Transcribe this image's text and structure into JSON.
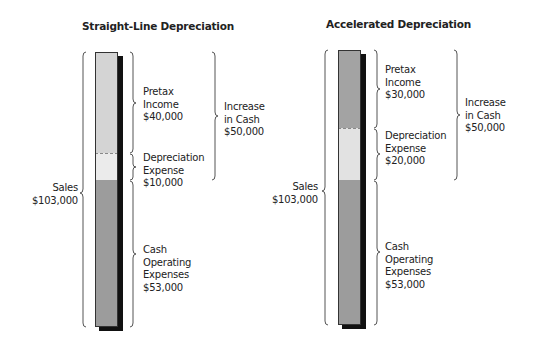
{
  "colors": {
    "background": "#ffffff",
    "shadow": "#111111",
    "brace": "#555555"
  },
  "charts": [
    {
      "id": "straight-line",
      "title": "Straight-Line Depreciation",
      "sales_label": "Sales\n$103,000",
      "segments": [
        {
          "name": "Pretax Income",
          "label": "Pretax\nIncome\n$40,000",
          "value": 40000,
          "color": "#d4d4d4"
        },
        {
          "name": "Depreciation Expense",
          "label": "Depreciation\nExpense\n$10,000",
          "value": 10000,
          "color": "#ebebeb"
        },
        {
          "name": "Cash Operating Expenses",
          "label": "Cash\nOperating\nExpenses\n$53,000",
          "value": 53000,
          "color": "#9c9c9c"
        }
      ],
      "increase_label": "Increase\nin Cash\n$50,000"
    },
    {
      "id": "accelerated",
      "title": "Accelerated Depreciation",
      "sales_label": "Sales\n$103,000",
      "segments": [
        {
          "name": "Pretax Income",
          "label": "Pretax\nIncome\n$30,000",
          "value": 30000,
          "color": "#a3a3a3"
        },
        {
          "name": "Depreciation Expense",
          "label": "Depreciation\nExpense\n$20,000",
          "value": 20000,
          "color": "#e2e2e2"
        },
        {
          "name": "Cash Operating Expenses",
          "label": "Cash\nOperating\nExpenses\n$53,000",
          "value": 53000,
          "color": "#9c9c9c"
        }
      ],
      "increase_label": "Increase\nin Cash\n$50,000"
    }
  ]
}
